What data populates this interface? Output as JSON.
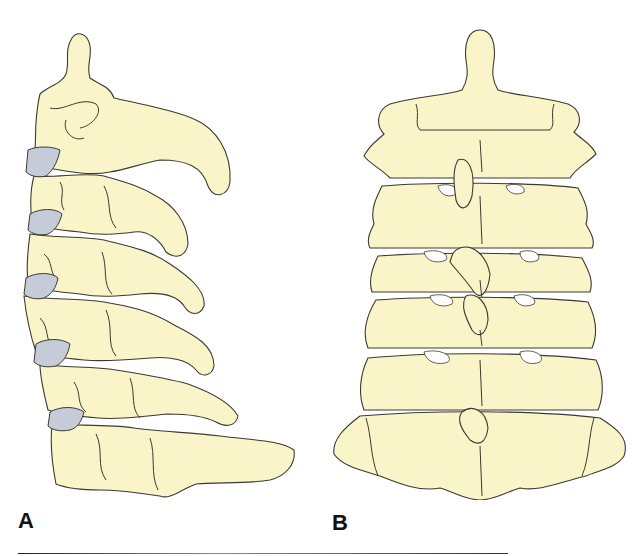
{
  "figure": {
    "panels": [
      {
        "id": "A",
        "label": "A",
        "view": "lateral"
      },
      {
        "id": "B",
        "label": "B",
        "view": "posterior"
      }
    ]
  },
  "colors": {
    "bone_fill": "#faf5c8",
    "disc_fill": "#c5cbd8",
    "outline": "#3a3a32",
    "background": "#ffffff"
  }
}
